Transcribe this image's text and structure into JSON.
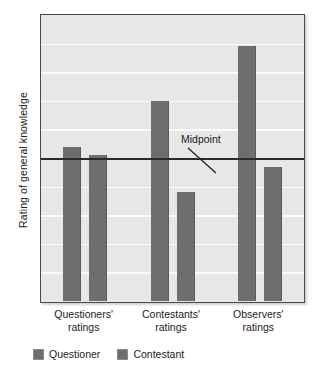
{
  "chart_data": {
    "type": "bar",
    "title": "",
    "subtitle": "",
    "xlabel": "",
    "ylabel": "Rating of general knowledge",
    "categories": [
      "Questioners' ratings",
      "Contestants' ratings",
      "Observers' ratings"
    ],
    "category_lines": [
      [
        "Questioners'",
        "ratings"
      ],
      [
        "Contestants'",
        "ratings"
      ],
      [
        "Observers'",
        "ratings"
      ]
    ],
    "series": [
      {
        "name": "Questioner",
        "values": [
          5.4,
          7.0,
          8.9
        ],
        "color": "#6e6e6e"
      },
      {
        "name": "Contestant",
        "values": [
          5.1,
          3.8,
          4.7
        ],
        "color": "#6e6e6e"
      }
    ],
    "ylim": [
      0,
      10
    ],
    "yticks": [],
    "grid": true,
    "gridlines_y": [
      1,
      2,
      3,
      4,
      5,
      6,
      7,
      8,
      9
    ],
    "legend_position": "bottom-left",
    "annotations": [
      {
        "label": "Midpoint",
        "value": 5.0,
        "type": "reference-line"
      }
    ],
    "reference_line": {
      "label": "Midpoint",
      "value": 5.0,
      "color": "#2a2a2a"
    },
    "colors": {
      "plot_background": "#e7e7e7",
      "gridline": "#fbfbfb",
      "bar": "#6e6e6e",
      "axis_border": "#4a4a4a",
      "text": "#1b1b1b",
      "page_background": "#ffffff"
    }
  },
  "axis": {
    "y_title": "Rating of general knowledge"
  },
  "legend": {
    "items": [
      {
        "label": "Questioner"
      },
      {
        "label": "Contestant"
      }
    ]
  },
  "annotation": {
    "midpoint_label": "Midpoint"
  }
}
